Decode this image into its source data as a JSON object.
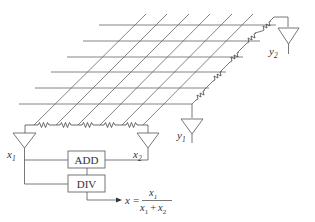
{
  "diagram": {
    "type": "resistive-grid position-sensing circuit",
    "blocks": {
      "add": "ADD",
      "div": "DIV"
    },
    "amplifiers": {
      "x1": {
        "var": "x",
        "sub": "1"
      },
      "x2": {
        "var": "x",
        "sub": "2"
      },
      "y1": {
        "var": "y",
        "sub": "1"
      },
      "y2": {
        "var": "y",
        "sub": "2"
      }
    },
    "output_formula": {
      "lhs": "x",
      "equals": "=",
      "numerator": {
        "var": "x",
        "sub": "1"
      },
      "denominator": {
        "a_var": "x",
        "a_sub": "1",
        "op": "+",
        "b_var": "x",
        "b_sub": "2"
      }
    },
    "grid": {
      "horizontal_lines": 6,
      "diagonal_lines": 6,
      "bottom_resistors": 5,
      "right_resistors": 6
    }
  }
}
